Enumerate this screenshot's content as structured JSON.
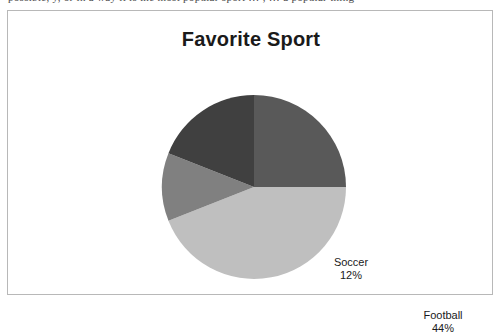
{
  "page": {
    "top_text_fragment": "possible, y, or in a way it is the most popular sport … , … a popular thing"
  },
  "chart_frame": {
    "border_color": "#b8b8b8",
    "background_color": "#ffffff"
  },
  "chart_data": {
    "type": "pie",
    "title": "Favorite Sport",
    "xlabel": "",
    "ylabel": "",
    "legend": "none",
    "grid": false,
    "start_angle_deg": 0,
    "direction": "clockwise",
    "categories": [
      "Basketball",
      "Football",
      "Soccer",
      "Baseball"
    ],
    "values": [
      25,
      44,
      12,
      19
    ],
    "value_unit": "%",
    "slices": [
      {
        "label": "Basketball",
        "value": 25,
        "value_text": "25%",
        "color": "#595959",
        "label_color": "#ffffff"
      },
      {
        "label": "Football",
        "value": 44,
        "value_text": "44%",
        "color": "#bfbfbf",
        "label_color": "#1a1a1a"
      },
      {
        "label": "Soccer",
        "value": 12,
        "value_text": "12%",
        "color": "#808080",
        "label_color": "#1a1a1a"
      },
      {
        "label": "Baseball",
        "value": 19,
        "value_text": "19%",
        "color": "#404040",
        "label_color": "#ffffff"
      }
    ]
  }
}
